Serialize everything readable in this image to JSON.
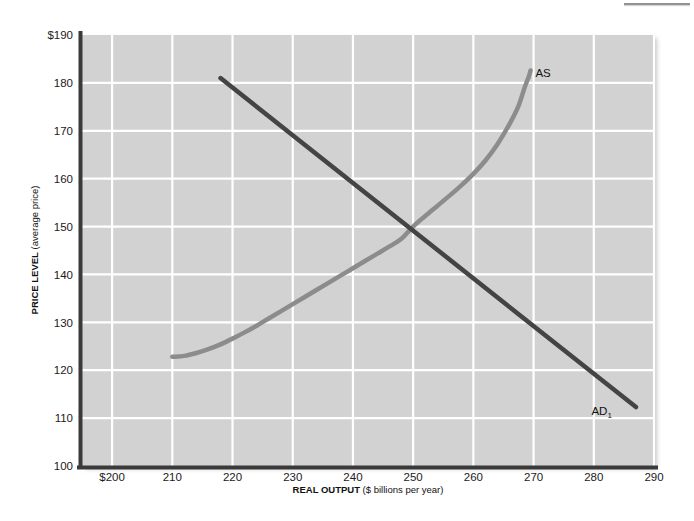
{
  "chart_data": {
    "type": "line",
    "title": "",
    "xlabel": "REAL OUTPUT ($ billions per year)",
    "xlabel_strong": "REAL OUTPUT",
    "xlabel_rest": " ($ billions per year)",
    "ylabel": "PRICE LEVEL (average price)",
    "ylabel_strong": "PRICE LEVEL",
    "ylabel_rest": " (average price)",
    "xlim": [
      195,
      290
    ],
    "ylim": [
      100,
      190
    ],
    "grid": true,
    "legend": "none",
    "plot_bg": "#d2d2d2",
    "grid_color": "#ffffff",
    "axis_color": "#3a3a3a",
    "x_ticks": [
      {
        "value": 200,
        "label": "$200"
      },
      {
        "value": 210,
        "label": "210"
      },
      {
        "value": 220,
        "label": "220"
      },
      {
        "value": 230,
        "label": "230"
      },
      {
        "value": 240,
        "label": "240"
      },
      {
        "value": 250,
        "label": "250"
      },
      {
        "value": 260,
        "label": "260"
      },
      {
        "value": 270,
        "label": "270"
      },
      {
        "value": 280,
        "label": "280"
      },
      {
        "value": 290,
        "label": "290"
      }
    ],
    "y_ticks": [
      {
        "value": 190,
        "label": "$190"
      },
      {
        "value": 180,
        "label": "180"
      },
      {
        "value": 170,
        "label": "170"
      },
      {
        "value": 160,
        "label": "160"
      },
      {
        "value": 150,
        "label": "150"
      },
      {
        "value": 140,
        "label": "140"
      },
      {
        "value": 130,
        "label": "130"
      },
      {
        "value": 120,
        "label": "120"
      },
      {
        "value": 110,
        "label": "110"
      },
      {
        "value": 100,
        "label": "100"
      }
    ],
    "series": [
      {
        "name": "AS",
        "label": "AS",
        "label_sub": "",
        "color": "#8c8c8c",
        "width": 4.5,
        "kind": "curve",
        "points": [
          [
            210.0,
            122.8
          ],
          [
            212.0,
            123.0
          ],
          [
            214.0,
            123.6
          ],
          [
            216.0,
            124.4
          ],
          [
            218.0,
            125.4
          ],
          [
            220.0,
            126.6
          ],
          [
            222.0,
            127.9
          ],
          [
            224.0,
            129.3
          ],
          [
            226.0,
            130.8
          ],
          [
            228.0,
            132.3
          ],
          [
            230.0,
            133.8
          ],
          [
            232.0,
            135.3
          ],
          [
            234.0,
            136.8
          ],
          [
            236.0,
            138.3
          ],
          [
            238.0,
            139.8
          ],
          [
            240.0,
            141.3
          ],
          [
            242.0,
            142.8
          ],
          [
            244.0,
            144.3
          ],
          [
            246.0,
            145.8
          ],
          [
            248.0,
            147.4
          ],
          [
            250.0,
            150.0
          ],
          [
            252.0,
            152.2
          ],
          [
            254.0,
            154.3
          ],
          [
            256.0,
            156.4
          ],
          [
            258.0,
            158.6
          ],
          [
            260.0,
            161.0
          ],
          [
            262.0,
            163.8
          ],
          [
            264.0,
            167.2
          ],
          [
            266.0,
            171.4
          ],
          [
            267.5,
            175.2
          ],
          [
            268.5,
            179.0
          ],
          [
            269.2,
            181.3
          ],
          [
            269.5,
            182.6
          ]
        ],
        "label_pos": [
          270.3,
          182.2
        ]
      },
      {
        "name": "AD1",
        "label": "AD",
        "label_sub": "1",
        "color": "#444444",
        "width": 4.5,
        "kind": "line",
        "points": [
          [
            218.0,
            181.0
          ],
          [
            287.0,
            112.3
          ]
        ],
        "label_pos": [
          283.0,
          111.5
        ]
      }
    ],
    "intersection": {
      "x": 250,
      "y": 150
    },
    "annotations": []
  }
}
